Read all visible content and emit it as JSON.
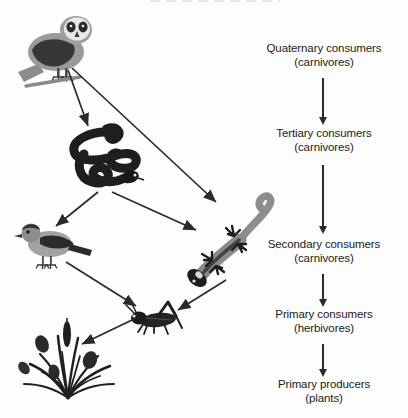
{
  "diagram": {
    "background_color": "#fdfdfd",
    "text_color": "#1b1b1b",
    "arrow_color": "#2a2a2a"
  },
  "levels": [
    {
      "id": "quaternary",
      "main": "Quaternary consumers",
      "paren": "(carnivores)"
    },
    {
      "id": "tertiary",
      "main": "Tertiary consumers",
      "paren": "(carnivores)"
    },
    {
      "id": "secondary",
      "main": "Secondary consumers",
      "paren": "(carnivores)"
    },
    {
      "id": "primary-consumers",
      "main": "Primary consumers",
      "paren": "(herbivores)"
    },
    {
      "id": "primary-producers",
      "main": "Primary producers",
      "paren": "(plants)"
    }
  ],
  "organisms": [
    {
      "id": "owl",
      "name": "owl",
      "trophic_level": "Quaternary consumers",
      "colors": {
        "body": "#8f8f8f",
        "wing": "#3a3a3a",
        "face": "#e8e8e8"
      }
    },
    {
      "id": "snake",
      "name": "snake",
      "trophic_level": "Tertiary consumers",
      "colors": {
        "body": "#1e1e1e"
      }
    },
    {
      "id": "bird",
      "name": "songbird",
      "trophic_level": "Secondary consumers",
      "colors": {
        "body": "#9a9a9a",
        "wing": "#2b2b2b"
      }
    },
    {
      "id": "lizard",
      "name": "lizard",
      "trophic_level": "Secondary consumers",
      "colors": {
        "body": "#8c8c8c",
        "limbs": "#1e1e1e"
      }
    },
    {
      "id": "grasshopper",
      "name": "grasshopper",
      "trophic_level": "Primary consumers",
      "colors": {
        "body": "#242424"
      }
    },
    {
      "id": "plants",
      "name": "grass-plants",
      "trophic_level": "Primary producers",
      "colors": {
        "body": "#1f1f1f"
      }
    }
  ],
  "food_web_links": [
    {
      "from": "owl",
      "to": "snake"
    },
    {
      "from": "owl",
      "to": "lizard"
    },
    {
      "from": "snake",
      "to": "bird"
    },
    {
      "from": "snake",
      "to": "lizard"
    },
    {
      "from": "bird",
      "to": "grasshopper"
    },
    {
      "from": "lizard",
      "to": "grasshopper"
    },
    {
      "from": "grasshopper",
      "to": "plants"
    }
  ]
}
